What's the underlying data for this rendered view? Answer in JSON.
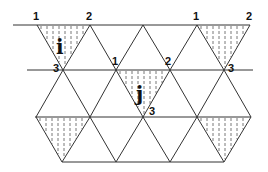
{
  "diagram": {
    "type": "triangular-lattice",
    "colors": {
      "line": "#333333",
      "hatch": "#555555",
      "text": "#111111",
      "background": "#ffffff"
    },
    "horizontal_lines": [
      {
        "y": 25,
        "x1": 13,
        "x2": 250
      },
      {
        "y": 70,
        "x1": 27,
        "x2": 253
      },
      {
        "y": 117,
        "x1": 35,
        "x2": 251
      },
      {
        "y": 162,
        "x1": 62,
        "x2": 224
      }
    ],
    "shaded_triangles": [
      {
        "name": "triangle-i",
        "points": [
          [
            37,
            25
          ],
          [
            90,
            25
          ],
          [
            63,
            70
          ]
        ]
      },
      {
        "name": "triangle-top-right",
        "points": [
          [
            197,
            25
          ],
          [
            250,
            25
          ],
          [
            224,
            70
          ]
        ]
      },
      {
        "name": "triangle-j",
        "points": [
          [
            116,
            70
          ],
          [
            170,
            70
          ],
          [
            143,
            117
          ]
        ]
      },
      {
        "name": "triangle-bottom-left",
        "points": [
          [
            36,
            117
          ],
          [
            90,
            117
          ],
          [
            62,
            162
          ]
        ]
      },
      {
        "name": "triangle-bottom-right",
        "points": [
          [
            197,
            117
          ],
          [
            251,
            117
          ],
          [
            224,
            162
          ]
        ]
      }
    ],
    "triangle_labels": [
      {
        "text": "i",
        "x": 56,
        "y": 54
      },
      {
        "text": "j",
        "x": 136,
        "y": 101
      }
    ],
    "vertex_labels": [
      {
        "text": "1",
        "x": 33,
        "y": 20
      },
      {
        "text": "2",
        "x": 86,
        "y": 20
      },
      {
        "text": "3",
        "x": 53,
        "y": 72
      },
      {
        "text": "1",
        "x": 112,
        "y": 65
      },
      {
        "text": "2",
        "x": 165,
        "y": 65
      },
      {
        "text": "3",
        "x": 149,
        "y": 115
      },
      {
        "text": "1",
        "x": 193,
        "y": 20
      },
      {
        "text": "2",
        "x": 246,
        "y": 20
      },
      {
        "text": "3",
        "x": 228,
        "y": 72
      }
    ]
  }
}
